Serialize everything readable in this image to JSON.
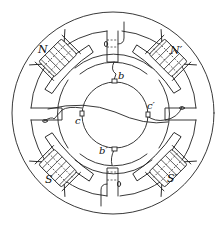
{
  "diagram": {
    "title": "",
    "colors": {
      "stroke": "#222222",
      "background": "#ffffff"
    },
    "poles": [
      {
        "id": "N",
        "label": "N",
        "x": 38,
        "y": 44
      },
      {
        "id": "N2",
        "label": "N′",
        "x": 170,
        "y": 45
      },
      {
        "id": "S",
        "label": "S",
        "x": 45,
        "y": 174
      },
      {
        "id": "S2",
        "label": "S′",
        "x": 167,
        "y": 173
      }
    ],
    "brushes": [
      {
        "id": "b",
        "label": "b",
        "x": 118,
        "y": 71
      },
      {
        "id": "b2",
        "label": "b′",
        "x": 99,
        "y": 146
      },
      {
        "id": "c",
        "label": "c",
        "x": 75,
        "y": 116
      },
      {
        "id": "c2",
        "label": "c′",
        "x": 147,
        "y": 101
      }
    ]
  }
}
